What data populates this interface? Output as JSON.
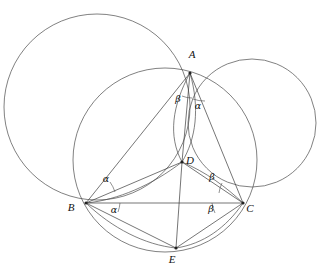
{
  "figure": {
    "background_color": "#ffffff",
    "stroke_color": "#4a4a4a",
    "label_color": "#111111",
    "width": 335,
    "height": 276
  },
  "points": [
    {
      "id": "A",
      "label": "A",
      "x": 190,
      "y": 73,
      "label_x": 192,
      "label_y": 58
    },
    {
      "id": "B",
      "label": "B",
      "x": 86,
      "y": 203,
      "label_x": 71,
      "label_y": 211
    },
    {
      "id": "C",
      "label": "C",
      "x": 243,
      "y": 203,
      "label_x": 250,
      "label_y": 212
    },
    {
      "id": "D",
      "label": "D",
      "x": 182,
      "y": 162,
      "label_x": 190,
      "label_y": 164
    },
    {
      "id": "E",
      "label": "E",
      "x": 176,
      "y": 248,
      "label_x": 172,
      "label_y": 263
    }
  ],
  "circles": [
    {
      "id": "left-circle",
      "name": "circle-through-A-B",
      "cx": 97,
      "cy": 107,
      "r": 93
    },
    {
      "id": "right-circle",
      "name": "circle-through-A-C",
      "cx": 252,
      "cy": 123,
      "r": 64
    },
    {
      "id": "circumcircle",
      "name": "circumcircle-ABCE",
      "cx": 165,
      "cy": 160,
      "r": 92
    }
  ],
  "segments": [
    {
      "name": "segment-AB",
      "from": "A",
      "to": "B"
    },
    {
      "name": "segment-AC",
      "from": "A",
      "to": "C"
    },
    {
      "name": "segment-BC",
      "from": "B",
      "to": "C"
    },
    {
      "name": "segment-AD",
      "from": "A",
      "to": "D"
    },
    {
      "name": "segment-BD",
      "from": "B",
      "to": "D"
    },
    {
      "name": "segment-CD",
      "from": "C",
      "to": "D"
    },
    {
      "name": "segment-DE",
      "from": "D",
      "to": "E"
    },
    {
      "name": "segment-BE",
      "from": "B",
      "to": "E"
    },
    {
      "name": "segment-CE",
      "from": "C",
      "to": "E"
    }
  ],
  "arcs": [
    {
      "name": "arc-AD-left",
      "d": "M 190 73 C 172 106 168 136 182 162"
    },
    {
      "name": "arc-AD-right",
      "d": "M 190 73 C 200 108 196 139 182 162"
    },
    {
      "name": "arc-BD",
      "d": "M 86 203 C 118 200 152 185 182 162"
    },
    {
      "name": "arc-CD",
      "d": "M 243 203 C 226 187 206 172 182 162"
    },
    {
      "name": "arc-BE",
      "d": "M 86 203 C 112 228 145 245 176 248"
    },
    {
      "name": "arc-CE",
      "d": "M 243 203 C 226 228 203 244 176 248"
    }
  ],
  "angle_labels": [
    {
      "name": "angle-beta-at-A",
      "symbol": "β",
      "x": 178,
      "y": 102,
      "vertex": "A"
    },
    {
      "name": "angle-alpha-at-A",
      "symbol": "α",
      "x": 198,
      "y": 109,
      "vertex": "A"
    },
    {
      "name": "angle-alpha-at-B-upper",
      "symbol": "α",
      "x": 106,
      "y": 182,
      "vertex": "B"
    },
    {
      "name": "angle-alpha-at-B-lower",
      "symbol": "α",
      "x": 114,
      "y": 213,
      "vertex": "B"
    },
    {
      "name": "angle-beta-at-C-upper",
      "symbol": "β",
      "x": 212,
      "y": 180,
      "vertex": "C"
    },
    {
      "name": "angle-beta-at-C-lower",
      "symbol": "β",
      "x": 211,
      "y": 212,
      "vertex": "C"
    }
  ],
  "angle_arcs": [
    {
      "name": "angle-arc-beta-A",
      "d": "M 182 96 A 26 26 0 0 0 192 98"
    },
    {
      "name": "angle-arc-alpha-A",
      "d": "M 193 99 A 33 33 0 0 0 205 101"
    },
    {
      "name": "angle-arc-alpha-B-upper",
      "d": "M 110 182 A 34 34 0 0 1 115 192"
    },
    {
      "name": "angle-arc-alpha-B-lower",
      "d": "M 120 203 A 34 34 0 0 1 118 212"
    },
    {
      "name": "angle-arc-beta-C-upper",
      "d": "M 222 183 A 32 32 0 0 0 219 193"
    },
    {
      "name": "angle-arc-beta-C-lower",
      "d": "M 212 203 A 32 32 0 0 0 215 213"
    }
  ]
}
